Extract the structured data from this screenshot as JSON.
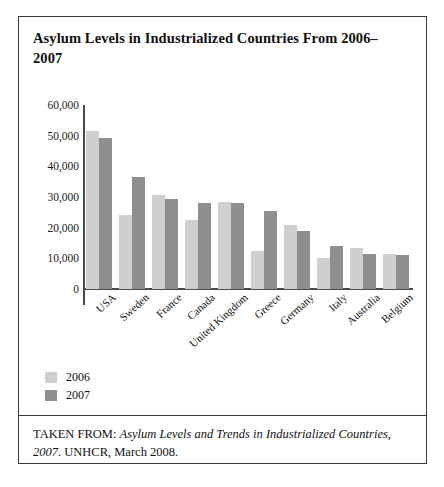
{
  "figure": {
    "title": "Asylum Levels in Industrialized Countries From 2006–2007",
    "source_prefix": "TAKEN FROM: ",
    "source_italic": "Asylum Levels and Trends in Industrialized Countries, 2007",
    "source_suffix": ". UNHCR, March 2008."
  },
  "legend": {
    "position": "below-plot",
    "items": [
      {
        "label": "2006",
        "color": "#cfcfcf"
      },
      {
        "label": "2007",
        "color": "#8e8e8e"
      }
    ]
  },
  "chart_data": {
    "type": "bar",
    "title": "Asylum Levels in Industrialized Countries From 2006–2007",
    "xlabel": "",
    "ylabel": "",
    "ylim": [
      0,
      60000
    ],
    "ytick_labels": [
      "60,000",
      "50,000",
      "40,000",
      "30,000",
      "20,000",
      "10,000",
      "0"
    ],
    "ytick_values": [
      60000,
      50000,
      40000,
      30000,
      20000,
      10000,
      0
    ],
    "grid": false,
    "categories": [
      "USA",
      "Sweden",
      "France",
      "Canada",
      "United Kingdom",
      "Greece",
      "Germany",
      "Italy",
      "Australia",
      "Belgium"
    ],
    "series": [
      {
        "name": "2006",
        "color": "#cfcfcf",
        "values": [
          51500,
          24000,
          30500,
          22500,
          28300,
          12500,
          21000,
          10000,
          13500,
          11500
        ]
      },
      {
        "name": "2007",
        "color": "#8e8e8e",
        "values": [
          49200,
          36500,
          29500,
          28000,
          28000,
          25500,
          19000,
          14000,
          11500,
          11000
        ]
      }
    ]
  }
}
